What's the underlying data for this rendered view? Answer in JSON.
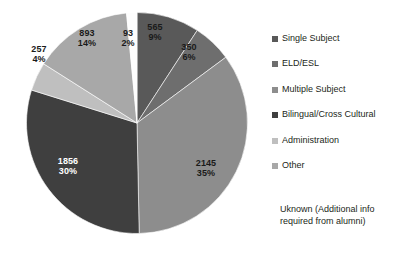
{
  "chart_data": {
    "type": "pie",
    "title": "",
    "legend_position": "right",
    "categories": [
      "Single Subject",
      "ELD/ESL",
      "Multiple Subject",
      "Bilingual/Cross Cultural",
      "Administration",
      "Other",
      "Unlabeled"
    ],
    "values": [
      565,
      350,
      2145,
      1856,
      257,
      893,
      93
    ],
    "percents": [
      9,
      6,
      35,
      30,
      4,
      14,
      2
    ],
    "labels": [
      {
        "value": "565",
        "percent": "9%"
      },
      {
        "value": "350",
        "percent": "6%"
      },
      {
        "value": "2145",
        "percent": "35%"
      },
      {
        "value": "1856",
        "percent": "30%"
      },
      {
        "value": "257",
        "percent": "4%"
      },
      {
        "value": "893",
        "percent": "14%"
      },
      {
        "value": "93",
        "percent": "2%"
      }
    ],
    "colors": [
      "#595959",
      "#6e6e6e",
      "#8d8d8d",
      "#3f3f3f",
      "#bfbfbf",
      "#a8a8a8",
      "#fdfdfd"
    ]
  },
  "legend": {
    "items": [
      {
        "label": "Single Subject",
        "color": "#595959"
      },
      {
        "label": "ELD/ESL",
        "color": "#6e6e6e"
      },
      {
        "label": "Multiple Subject",
        "color": "#8d8d8d"
      },
      {
        "label": "Bilingual/Cross Cultural",
        "color": "#3f3f3f"
      },
      {
        "label": "Administration",
        "color": "#bfbfbf"
      },
      {
        "label": "Other",
        "color": "#a8a8a8"
      }
    ],
    "note": "Uknown (Additional info required from alumni)"
  }
}
